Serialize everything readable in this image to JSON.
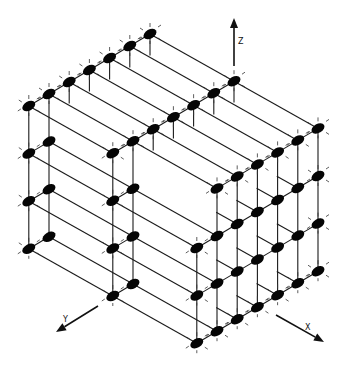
{
  "diagram": {
    "projection": {
      "origin": [
        150,
        34
      ],
      "ex": [
        21.0,
        11.8
      ],
      "ey": [
        -20.2,
        12.0
      ],
      "ez": [
        0,
        -47.6
      ],
      "k_top": 3
    },
    "node_style": {
      "rx": 7,
      "ry": 4.5,
      "rotate": -30,
      "color": "#050505"
    },
    "rod_color": "#1a1a1a",
    "nodes": [
      [
        0,
        0,
        3
      ],
      [
        0,
        1,
        3
      ],
      [
        0,
        2,
        3
      ],
      [
        0,
        3,
        3
      ],
      [
        0,
        4,
        3
      ],
      [
        0,
        5,
        3
      ],
      [
        0,
        6,
        3
      ],
      [
        0,
        6,
        2
      ],
      [
        0,
        6,
        1
      ],
      [
        0,
        6,
        0
      ],
      [
        0,
        5,
        2
      ],
      [
        0,
        5,
        1
      ],
      [
        0,
        5,
        0
      ],
      [
        4,
        0,
        3
      ],
      [
        4,
        1,
        3
      ],
      [
        4,
        2,
        3
      ],
      [
        4,
        3,
        3
      ],
      [
        4,
        4,
        3
      ],
      [
        4,
        5,
        3
      ],
      [
        4,
        6,
        3
      ],
      [
        4,
        6,
        2
      ],
      [
        4,
        6,
        1
      ],
      [
        4,
        6,
        0
      ],
      [
        4,
        5,
        2
      ],
      [
        4,
        5,
        1
      ],
      [
        4,
        5,
        0
      ],
      [
        8,
        0,
        3
      ],
      [
        8,
        1,
        3
      ],
      [
        8,
        2,
        3
      ],
      [
        8,
        3,
        3
      ],
      [
        8,
        4,
        3
      ],
      [
        8,
        5,
        3
      ],
      [
        8,
        0,
        2
      ],
      [
        8,
        1,
        2
      ],
      [
        8,
        2,
        2
      ],
      [
        8,
        3,
        2
      ],
      [
        8,
        4,
        2
      ],
      [
        8,
        5,
        2
      ],
      [
        8,
        6,
        2
      ],
      [
        8,
        0,
        1
      ],
      [
        8,
        1,
        1
      ],
      [
        8,
        2,
        1
      ],
      [
        8,
        3,
        1
      ],
      [
        8,
        4,
        1
      ],
      [
        8,
        5,
        1
      ],
      [
        8,
        6,
        1
      ],
      [
        8,
        0,
        0
      ],
      [
        8,
        1,
        0
      ],
      [
        8,
        2,
        0
      ],
      [
        8,
        3,
        0
      ],
      [
        8,
        4,
        0
      ],
      [
        8,
        5,
        0
      ],
      [
        8,
        6,
        0
      ]
    ],
    "tick_nodes": [
      [
        0,
        0,
        3
      ],
      [
        0,
        1,
        3
      ],
      [
        0,
        2,
        3
      ],
      [
        0,
        3,
        3
      ],
      [
        0,
        4,
        3
      ],
      [
        0,
        5,
        3
      ],
      [
        0,
        6,
        3
      ],
      [
        0,
        6,
        2
      ],
      [
        0,
        6,
        1
      ],
      [
        0,
        6,
        0
      ],
      [
        4,
        0,
        3
      ],
      [
        4,
        1,
        3
      ],
      [
        4,
        2,
        3
      ],
      [
        4,
        3,
        3
      ],
      [
        4,
        4,
        3
      ],
      [
        4,
        5,
        3
      ],
      [
        4,
        6,
        3
      ],
      [
        4,
        6,
        2
      ],
      [
        4,
        6,
        1
      ],
      [
        4,
        6,
        0
      ],
      [
        8,
        0,
        3
      ],
      [
        8,
        1,
        3
      ],
      [
        8,
        2,
        3
      ],
      [
        8,
        3,
        3
      ],
      [
        8,
        4,
        3
      ],
      [
        8,
        5,
        3
      ],
      [
        8,
        0,
        2
      ],
      [
        8,
        0,
        1
      ],
      [
        8,
        0,
        0
      ],
      [
        8,
        6,
        2
      ],
      [
        8,
        6,
        1
      ],
      [
        8,
        6,
        0
      ],
      [
        8,
        1,
        0
      ],
      [
        8,
        2,
        0
      ],
      [
        8,
        3,
        0
      ],
      [
        8,
        4,
        0
      ],
      [
        8,
        5,
        0
      ]
    ],
    "rods": [
      [
        [
          0,
          0,
          3
        ],
        [
          0,
          6,
          3
        ]
      ],
      [
        [
          4,
          0,
          3
        ],
        [
          4,
          6,
          3
        ]
      ],
      [
        [
          8,
          0,
          3
        ],
        [
          8,
          5,
          3
        ]
      ],
      [
        [
          8,
          0,
          2
        ],
        [
          8,
          6,
          2
        ]
      ],
      [
        [
          8,
          0,
          1
        ],
        [
          8,
          6,
          1
        ]
      ],
      [
        [
          8,
          0,
          0
        ],
        [
          8,
          6,
          0
        ]
      ],
      [
        [
          0,
          5,
          2
        ],
        [
          0,
          6,
          2
        ]
      ],
      [
        [
          0,
          5,
          1
        ],
        [
          0,
          6,
          1
        ]
      ],
      [
        [
          0,
          5,
          0
        ],
        [
          0,
          6,
          0
        ]
      ],
      [
        [
          4,
          5,
          2
        ],
        [
          4,
          6,
          2
        ]
      ],
      [
        [
          4,
          5,
          1
        ],
        [
          4,
          6,
          1
        ]
      ],
      [
        [
          4,
          5,
          0
        ],
        [
          4,
          6,
          0
        ]
      ],
      [
        [
          0,
          0,
          3
        ],
        [
          8,
          0,
          3
        ]
      ],
      [
        [
          0,
          1,
          3
        ],
        [
          8,
          1,
          3
        ]
      ],
      [
        [
          0,
          2,
          3
        ],
        [
          8,
          2,
          3
        ]
      ],
      [
        [
          0,
          3,
          3
        ],
        [
          8,
          3,
          3
        ]
      ],
      [
        [
          0,
          4,
          3
        ],
        [
          8,
          4,
          3
        ]
      ],
      [
        [
          0,
          5,
          3
        ],
        [
          8,
          5,
          3
        ]
      ],
      [
        [
          0,
          6,
          3
        ],
        [
          4,
          6,
          3
        ]
      ],
      [
        [
          0,
          6,
          2
        ],
        [
          8,
          6,
          2
        ]
      ],
      [
        [
          0,
          6,
          1
        ],
        [
          8,
          6,
          1
        ]
      ],
      [
        [
          0,
          6,
          0
        ],
        [
          8,
          6,
          0
        ]
      ],
      [
        [
          0,
          5,
          2
        ],
        [
          4,
          5,
          2
        ]
      ],
      [
        [
          0,
          5,
          1
        ],
        [
          4,
          5,
          1
        ]
      ],
      [
        [
          0,
          5,
          0
        ],
        [
          4,
          5,
          0
        ]
      ],
      [
        [
          4,
          5,
          2
        ],
        [
          8,
          5,
          2
        ]
      ],
      [
        [
          4,
          5,
          1
        ],
        [
          8,
          5,
          1
        ]
      ],
      [
        [
          4,
          5,
          0
        ],
        [
          8,
          5,
          0
        ]
      ],
      [
        [
          7,
          4,
          2
        ],
        [
          8,
          4,
          2
        ]
      ],
      [
        [
          7,
          4,
          1
        ],
        [
          8,
          4,
          1
        ]
      ],
      [
        [
          7,
          4,
          0
        ],
        [
          8,
          4,
          0
        ]
      ],
      [
        [
          7,
          3,
          2
        ],
        [
          8,
          3,
          2
        ]
      ],
      [
        [
          7,
          3,
          1
        ],
        [
          8,
          3,
          1
        ]
      ],
      [
        [
          7,
          3,
          0
        ],
        [
          8,
          3,
          0
        ]
      ],
      [
        [
          7,
          2,
          2
        ],
        [
          8,
          2,
          2
        ]
      ],
      [
        [
          7,
          2,
          1
        ],
        [
          8,
          2,
          1
        ]
      ],
      [
        [
          7,
          2,
          0
        ],
        [
          8,
          2,
          0
        ]
      ],
      [
        [
          7,
          1,
          2
        ],
        [
          8,
          1,
          2
        ]
      ],
      [
        [
          7,
          1,
          1
        ],
        [
          8,
          1,
          1
        ]
      ],
      [
        [
          7,
          1,
          0
        ],
        [
          8,
          1,
          0
        ]
      ],
      [
        [
          0,
          0,
          3
        ],
        [
          0,
          0,
          2.55
        ]
      ],
      [
        [
          0,
          1,
          3
        ],
        [
          0,
          1,
          2.55
        ]
      ],
      [
        [
          0,
          2,
          3
        ],
        [
          0,
          2,
          2.55
        ]
      ],
      [
        [
          0,
          3,
          3
        ],
        [
          0,
          3,
          2.55
        ]
      ],
      [
        [
          0,
          4,
          3
        ],
        [
          0,
          4,
          2.55
        ]
      ],
      [
        [
          0,
          5,
          3
        ],
        [
          0,
          5,
          0
        ]
      ],
      [
        [
          0,
          6,
          3
        ],
        [
          0,
          6,
          0
        ]
      ],
      [
        [
          4,
          0,
          3
        ],
        [
          4,
          0,
          2.55
        ]
      ],
      [
        [
          4,
          1,
          3
        ],
        [
          4,
          1,
          2.55
        ]
      ],
      [
        [
          4,
          2,
          3
        ],
        [
          4,
          2,
          2.55
        ]
      ],
      [
        [
          4,
          3,
          3
        ],
        [
          4,
          3,
          2.55
        ]
      ],
      [
        [
          4,
          4,
          3
        ],
        [
          4,
          4,
          2.55
        ]
      ],
      [
        [
          4,
          5,
          3
        ],
        [
          4,
          5,
          0
        ]
      ],
      [
        [
          4,
          6,
          3
        ],
        [
          4,
          6,
          0
        ]
      ],
      [
        [
          8,
          0,
          3
        ],
        [
          8,
          0,
          0
        ]
      ],
      [
        [
          8,
          1,
          3
        ],
        [
          8,
          1,
          0
        ]
      ],
      [
        [
          8,
          2,
          3
        ],
        [
          8,
          2,
          0
        ]
      ],
      [
        [
          8,
          3,
          3
        ],
        [
          8,
          3,
          0
        ]
      ],
      [
        [
          8,
          4,
          3
        ],
        [
          8,
          4,
          0
        ]
      ],
      [
        [
          8,
          5,
          3
        ],
        [
          8,
          5,
          0
        ]
      ],
      [
        [
          8,
          6,
          2
        ],
        [
          8,
          6,
          0
        ]
      ]
    ],
    "axes": [
      {
        "name": "z-axis",
        "label": "Z",
        "from": [
          234,
          66
        ],
        "to": [
          234,
          18
        ],
        "label_pos": [
          238,
          44
        ]
      },
      {
        "name": "y-axis",
        "label": "Y",
        "from": [
          98,
          306
        ],
        "to": [
          56,
          332
        ],
        "label_pos": [
          63,
          322
        ]
      },
      {
        "name": "x-axis",
        "label": "X",
        "from": [
          276,
          315
        ],
        "to": [
          324,
          342
        ],
        "label_pos": [
          305,
          330
        ]
      }
    ]
  }
}
